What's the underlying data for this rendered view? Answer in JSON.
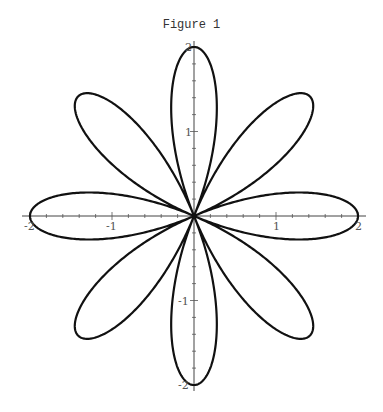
{
  "chart_data": {
    "type": "line",
    "title": "Figure 1",
    "equation": "r = 2*cos(4*theta)",
    "petals": 8,
    "amplitude": 2,
    "xlabel": "",
    "ylabel": "",
    "xlim": [
      -2,
      2
    ],
    "ylim": [
      -2,
      2
    ],
    "x_ticks": [
      -2,
      -1,
      1,
      2
    ],
    "y_ticks": [
      -2,
      -1,
      1,
      2
    ],
    "x_tick_labels": [
      "-2",
      "-1",
      "1",
      "2"
    ],
    "y_tick_labels": [
      "-2",
      "-1",
      "1",
      "2"
    ],
    "grid": false,
    "legend": null,
    "line_color": "#111111"
  },
  "figure": {
    "title": "Figure 1"
  }
}
